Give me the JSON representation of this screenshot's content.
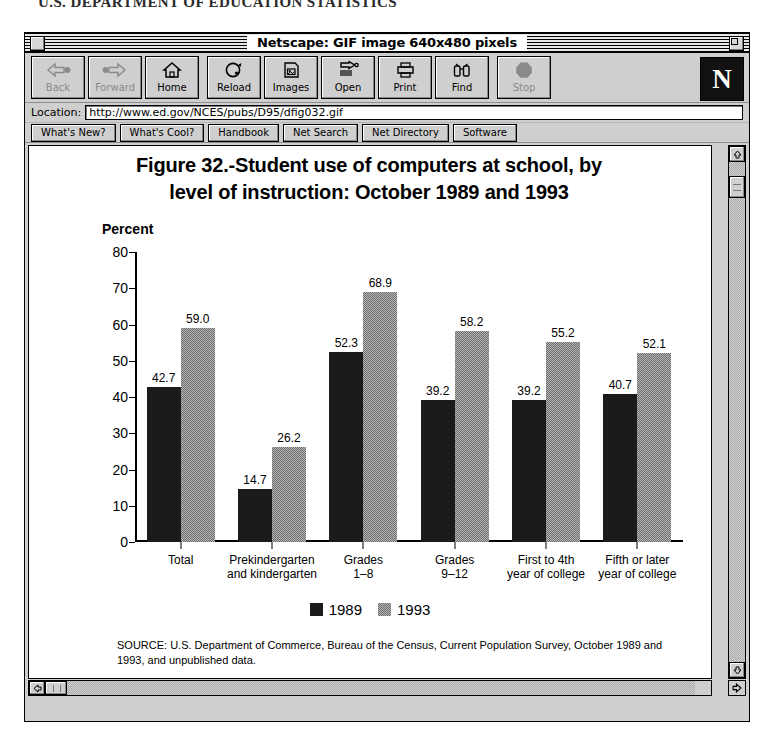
{
  "page_header": "U.S. DEPARTMENT OF EDUCATION STATISTICS",
  "window": {
    "title": "Netscape: GIF image 640x480 pixels",
    "close_box": "close-box",
    "zoom_box": "zoom-box"
  },
  "toolbar": {
    "buttons": [
      {
        "label": "Back",
        "icon": "back-arrow-icon",
        "disabled": true
      },
      {
        "label": "Forward",
        "icon": "forward-arrow-icon",
        "disabled": true
      },
      {
        "label": "Home",
        "icon": "house-icon",
        "disabled": false
      },
      {
        "label": "Reload",
        "icon": "reload-icon",
        "disabled": false
      },
      {
        "label": "Images",
        "icon": "images-icon",
        "disabled": false
      },
      {
        "label": "Open",
        "icon": "open-icon",
        "disabled": false
      },
      {
        "label": "Print",
        "icon": "printer-icon",
        "disabled": false
      },
      {
        "label": "Find",
        "icon": "binoculars-icon",
        "disabled": false
      },
      {
        "label": "Stop",
        "icon": "stop-sign-icon",
        "disabled": true
      }
    ],
    "logo": "N"
  },
  "location": {
    "label": "Location:",
    "value": "http://www.ed.gov/NCES/pubs/D95/dfig032.gif",
    "placeholder": ""
  },
  "directory_buttons": [
    "What's New?",
    "What's Cool?",
    "Handbook",
    "Net Search",
    "Net Directory",
    "Software"
  ],
  "scrollbars": {
    "v_up": "scroll-up-arrow-icon",
    "v_down": "scroll-down-arrow-icon",
    "h_left": "scroll-left-arrow-icon",
    "h_right": "scroll-right-arrow-icon"
  },
  "colors": {
    "series_1989": "#1b1b1b",
    "series_1993": "#8f8f8f",
    "window_chrome": "#cfcfcf",
    "canvas": "#ffffff"
  },
  "chart_data": {
    "type": "bar",
    "title": "Figure 32.-Student use of computers at school, by level of instruction:  October 1989 and 1993",
    "title_line_1": "Figure 32.-Student use of computers at school, by",
    "title_line_2": "level of instruction:  October 1989 and 1993",
    "xlabel": "",
    "ylabel": "Percent",
    "ylim": [
      0,
      80
    ],
    "yticks": [
      0,
      10,
      20,
      30,
      40,
      50,
      60,
      70,
      80
    ],
    "grid": false,
    "legend_position": "bottom-center",
    "categories": [
      "Total",
      "Prekindergarten and kindergarten",
      "Grades 1–8",
      "Grades 9–12",
      "First to 4th year of college",
      "Fifth or later year of college"
    ],
    "category_lines": [
      [
        "Total"
      ],
      [
        "Prekindergarten",
        "and kindergarten"
      ],
      [
        "Grades",
        "1–8"
      ],
      [
        "Grades",
        "9–12"
      ],
      [
        "First to 4th",
        "year of college"
      ],
      [
        "Fifth or later",
        "year of college"
      ]
    ],
    "series": [
      {
        "name": "1989",
        "color": "#1b1b1b",
        "values": [
          42.7,
          14.7,
          52.3,
          39.2,
          39.2,
          40.7
        ],
        "labels": [
          "42.7",
          "14.7",
          "52.3",
          "39.2",
          "39.2",
          "40.7"
        ]
      },
      {
        "name": "1993",
        "color": "#8f8f8f",
        "values": [
          59.0,
          26.2,
          68.9,
          58.2,
          55.2,
          52.1
        ],
        "labels": [
          "59.0",
          "26.2",
          "68.9",
          "58.2",
          "55.2",
          "52.1"
        ]
      }
    ],
    "source_note": "SOURCE:  U.S. Department of Commerce, Bureau of the Census, Current Population Survey, October 1989 and 1993, and unpublished data."
  }
}
